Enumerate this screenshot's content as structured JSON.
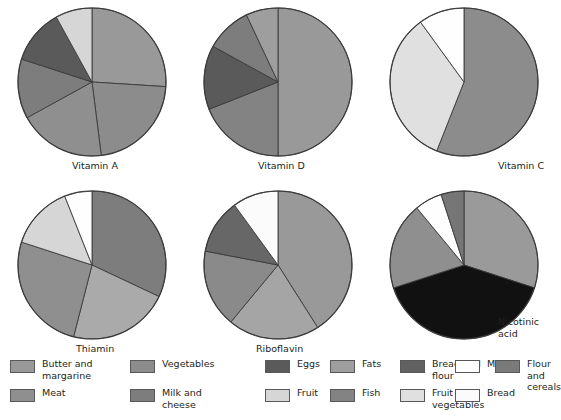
{
  "figure": {
    "title": "",
    "background": "#ffffff"
  },
  "palette": {
    "butter_and_margarine": "#999999",
    "meat": "#8f8f8f",
    "vegetables": "#8c8c8c",
    "milk_and_cheese": "#7d7d7d",
    "eggs": "#5a5a5a",
    "fruit": "#d6d6d6",
    "fats": "#9e9e9e",
    "fish": "#838383",
    "bread_and_flour": "#616161",
    "fruit_and_vegetables": "#e0e0e0",
    "milk": "#fefefe",
    "bread": "#fbfbfb",
    "flour_and_cereals": "#7a7a7a",
    "meat_dark": "#111111",
    "outline": "#3b3b3b"
  },
  "legend": {
    "items": [
      {
        "label": "Butter and\nmargarine",
        "color": "#999999",
        "row": 0,
        "col": 0
      },
      {
        "label": "Meat",
        "color": "#8f8f8f",
        "row": 1,
        "col": 0
      },
      {
        "label": "Vegetables",
        "color": "#8c8c8c",
        "row": 0,
        "col": 1
      },
      {
        "label": "Milk and\ncheese",
        "color": "#7d7d7d",
        "row": 1,
        "col": 1
      },
      {
        "label": "Eggs",
        "color": "#5a5a5a",
        "row": 0,
        "col": 2
      },
      {
        "label": "Fruit",
        "color": "#d6d6d6",
        "row": 1,
        "col": 2
      },
      {
        "label": "Fats",
        "color": "#9e9e9e",
        "row": 0,
        "col": 3
      },
      {
        "label": "Fish",
        "color": "#838383",
        "row": 1,
        "col": 3
      },
      {
        "label": "Bread and\nflour",
        "color": "#616161",
        "row": 0,
        "col": 4
      },
      {
        "label": "Fruit and\nvegetables",
        "color": "#e0e0e0",
        "row": 1,
        "col": 4
      },
      {
        "label": "Milk",
        "color": "#fefefe",
        "row": 0,
        "col": 5
      },
      {
        "label": "Bread",
        "color": "#fbfbfb",
        "row": 1,
        "col": 5
      },
      {
        "label": "Flour and\ncereals",
        "color": "#7a7a7a",
        "row": 0,
        "col": 6
      }
    ],
    "columns_x": [
      10,
      130,
      265,
      330,
      400,
      455,
      495
    ],
    "rows_y": [
      2,
      31
    ]
  },
  "chart_data": [
    {
      "type": "pie",
      "title": "Vitamin A",
      "cx": 92,
      "cy": 82,
      "r": 74,
      "start_angle": 0,
      "direction": "clockwise",
      "labels": [
        "Butter and margarine",
        "Vegetables",
        "Meat",
        "Milk and cheese",
        "Eggs",
        "Fruit"
      ],
      "values": [
        26,
        22,
        19,
        13,
        12,
        8
      ],
      "colors": [
        "#999999",
        "#8c8c8c",
        "#8f8f8f",
        "#7d7d7d",
        "#5a5a5a",
        "#d6d6d6"
      ],
      "xlabel": "",
      "ylabel": "",
      "grid": false,
      "legend_position": "bottom"
    },
    {
      "type": "pie",
      "title": "Vitamin D",
      "cx": 278,
      "cy": 82,
      "r": 74,
      "start_angle": 0,
      "direction": "clockwise",
      "labels": [
        "Butter and margarine",
        "Fish",
        "Eggs",
        "Milk and cheese",
        "Fats"
      ],
      "values": [
        50,
        19,
        14,
        10,
        7
      ],
      "colors": [
        "#999999",
        "#838383",
        "#5a5a5a",
        "#7d7d7d",
        "#9e9e9e"
      ],
      "xlabel": "",
      "ylabel": "",
      "grid": false,
      "legend_position": "bottom"
    },
    {
      "type": "pie",
      "title": "Vitamin C",
      "cx": 464,
      "cy": 82,
      "r": 74,
      "start_angle": 0,
      "direction": "clockwise",
      "labels": [
        "Vegetables",
        "Fruit",
        "Fruit and vegetables"
      ],
      "values": [
        56,
        34,
        10
      ],
      "colors": [
        "#8c8c8c",
        "#e0e0e0",
        "#fefefe"
      ],
      "xlabel": "",
      "ylabel": "",
      "grid": false,
      "legend_position": "bottom"
    },
    {
      "type": "pie",
      "title": "Thiamin",
      "cx": 92,
      "cy": 265,
      "r": 74,
      "start_angle": 0,
      "direction": "clockwise",
      "labels": [
        "Bread and flour",
        "Vegetables",
        "Meat",
        "Fruit",
        "Milk"
      ],
      "values": [
        32,
        22,
        26,
        14,
        6
      ],
      "colors": [
        "#7d7d7d",
        "#aaaaaa",
        "#8f8f8f",
        "#d6d6d6",
        "#fefefe"
      ],
      "xlabel": "",
      "ylabel": "",
      "grid": false,
      "legend_position": "bottom"
    },
    {
      "type": "pie",
      "title": "Riboflavin",
      "cx": 278,
      "cy": 265,
      "r": 74,
      "start_angle": 0,
      "direction": "clockwise",
      "labels": [
        "Milk and cheese",
        "Vegetables",
        "Meat",
        "Eggs",
        "Bread"
      ],
      "values": [
        41,
        20,
        17,
        12,
        10
      ],
      "colors": [
        "#999999",
        "#a5a5a5",
        "#8a8a8a",
        "#676767",
        "#fbfbfb"
      ],
      "xlabel": "",
      "ylabel": "",
      "grid": false,
      "legend_position": "bottom"
    },
    {
      "type": "pie",
      "title": "Nicotinic acid",
      "cx": 464,
      "cy": 265,
      "r": 74,
      "start_angle": 0,
      "direction": "clockwise",
      "labels": [
        "Flour and cereals",
        "Meat",
        "Vegetables",
        "Milk",
        "Eggs"
      ],
      "values": [
        30,
        40,
        19,
        6,
        5
      ],
      "colors": [
        "#9a9a9a",
        "#111111",
        "#8f8f8f",
        "#fefefe",
        "#767676"
      ],
      "xlabel": "",
      "ylabel": "",
      "grid": false,
      "legend_position": "bottom"
    }
  ],
  "captions": [
    {
      "text": "Vitamin A",
      "x": 72,
      "y": 160
    },
    {
      "text": "Vitamin D",
      "x": 258,
      "y": 160
    },
    {
      "text": "Vitamin C",
      "x": 498,
      "y": 160
    },
    {
      "text": "Thiamin",
      "x": 76,
      "y": 343
    },
    {
      "text": "Riboflavin",
      "x": 256,
      "y": 343
    },
    {
      "text": "Nicotinic\nacid",
      "x": 498,
      "y": 316
    }
  ]
}
